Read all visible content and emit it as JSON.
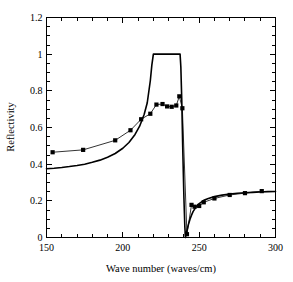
{
  "chart_data": {
    "type": "line",
    "title": "",
    "subtitle": "",
    "xlabel": "Wave number (waves/cm)",
    "ylabel": "Reflectivity",
    "xlim": [
      150,
      300
    ],
    "ylim": [
      0,
      1.2
    ],
    "xticks": [
      150,
      200,
      250,
      300
    ],
    "xticklabels": [
      "150",
      "200",
      "250",
      "300"
    ],
    "yticks": [
      0,
      0.2,
      0.4,
      0.6,
      0.8,
      1,
      1.2
    ],
    "yticklabels": [
      "0",
      "0.2",
      "0.4",
      "0.6",
      "0.8",
      "1",
      "1.2"
    ],
    "x_minor_tick_step": 10,
    "y_minor_tick_step": 0.05,
    "grid": false,
    "legend": null,
    "legend_position": "none",
    "frame": "box",
    "series": [
      {
        "name": "Measured reflectivity",
        "style": "markers-with-line",
        "marker": "square",
        "marker_size": 4.2,
        "color": "#000000",
        "x": [
          154,
          174,
          195,
          205,
          212,
          218,
          222,
          226,
          229,
          232,
          235,
          237,
          239,
          242,
          245,
          247,
          250,
          253,
          260,
          270,
          280,
          291
        ],
        "y": [
          0.465,
          0.478,
          0.53,
          0.585,
          0.645,
          0.675,
          0.725,
          0.728,
          0.715,
          0.713,
          0.72,
          0.77,
          0.705,
          0.018,
          0.178,
          0.168,
          0.172,
          0.192,
          0.213,
          0.232,
          0.242,
          0.253
        ]
      },
      {
        "name": "Calculated reflectivity",
        "style": "line",
        "marker": "none",
        "color": "#000000",
        "x": [
          150,
          155,
          160,
          165,
          170,
          175,
          180,
          185,
          190,
          195,
          200,
          204,
          208,
          211,
          214,
          216,
          218,
          219,
          220,
          228,
          234,
          237.5,
          238,
          238.6,
          239.2,
          240,
          240.6,
          241,
          241.3,
          242,
          243,
          244,
          245,
          246,
          248,
          250,
          253,
          256,
          260,
          265,
          270,
          275,
          280,
          285,
          290,
          295,
          300
        ],
        "y": [
          0.375,
          0.378,
          0.382,
          0.387,
          0.393,
          0.4,
          0.41,
          0.422,
          0.438,
          0.458,
          0.487,
          0.518,
          0.562,
          0.607,
          0.672,
          0.735,
          0.855,
          0.94,
          1.0,
          1.0,
          1.0,
          1.0,
          0.93,
          0.75,
          0.5,
          0.22,
          0.06,
          0.0,
          0.012,
          0.038,
          0.072,
          0.1,
          0.122,
          0.141,
          0.167,
          0.185,
          0.203,
          0.213,
          0.223,
          0.231,
          0.237,
          0.241,
          0.244,
          0.246,
          0.248,
          0.25,
          0.251
        ]
      }
    ]
  }
}
